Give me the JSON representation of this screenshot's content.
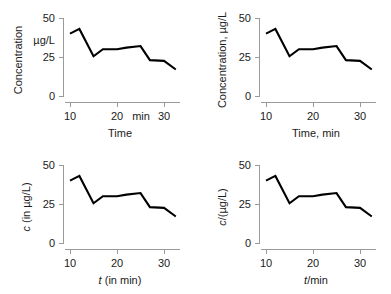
{
  "figure": {
    "name": "axis-labelling-conventions-figure",
    "panel_count": 4,
    "line_color": "#000000",
    "axis_color": "#9a9a9a"
  },
  "chart_data": [
    {
      "id": "top-left",
      "type": "line",
      "title": "",
      "xlabel": "Time",
      "ylabel": "Concentration",
      "y_unit_label": "µg/L",
      "x_unit_inline": "min",
      "xticks": [
        10,
        20,
        30
      ],
      "xticklabels": [
        "10",
        "20",
        "30"
      ],
      "yticks": [
        0,
        25,
        50
      ],
      "yticklabels": [
        "0",
        "25",
        "50"
      ],
      "xlim": [
        9,
        33.5
      ],
      "ylim": [
        0,
        50
      ],
      "grid": false,
      "legend": "none",
      "x": [
        10,
        12,
        15,
        17,
        20,
        22,
        25,
        27,
        30,
        32.5
      ],
      "values": [
        40,
        43,
        25.5,
        30,
        30,
        31,
        32,
        23,
        22.5,
        17
      ]
    },
    {
      "id": "top-right",
      "type": "line",
      "title": "",
      "xlabel": "Time, min",
      "ylabel": "Concentration, µg/L",
      "y_unit_label": "",
      "x_unit_inline": "",
      "xticks": [
        10,
        20,
        30
      ],
      "xticklabels": [
        "10",
        "20",
        "30"
      ],
      "yticks": [
        0,
        25,
        50
      ],
      "yticklabels": [
        "0",
        "25",
        "50"
      ],
      "xlim": [
        9,
        33.5
      ],
      "ylim": [
        0,
        50
      ],
      "grid": false,
      "legend": "none",
      "x": [
        10,
        12,
        15,
        17,
        20,
        22,
        25,
        27,
        30,
        32.5
      ],
      "values": [
        40,
        43,
        25.5,
        30,
        30,
        31,
        32,
        23,
        22.5,
        17
      ]
    },
    {
      "id": "bottom-left",
      "type": "line",
      "title": "",
      "xlabel": "t (in min)",
      "xlabel_symbol": "t",
      "xlabel_rest": " (in min)",
      "ylabel": "c (in µg/L)",
      "ylabel_symbol": "c",
      "ylabel_rest": " (in µg/L)",
      "y_unit_label": "",
      "x_unit_inline": "",
      "xticks": [
        10,
        20,
        30
      ],
      "xticklabels": [
        "10",
        "20",
        "30"
      ],
      "yticks": [
        0,
        25,
        50
      ],
      "yticklabels": [
        "0",
        "25",
        "50"
      ],
      "xlim": [
        9,
        33.5
      ],
      "ylim": [
        0,
        50
      ],
      "grid": false,
      "legend": "none",
      "x": [
        10,
        12,
        15,
        17,
        20,
        22,
        25,
        27,
        30,
        32.5
      ],
      "values": [
        40,
        43,
        25.5,
        30,
        30,
        31,
        32,
        23,
        22.5,
        17
      ]
    },
    {
      "id": "bottom-right",
      "type": "line",
      "title": "",
      "xlabel": "t/min",
      "xlabel_symbol": "t",
      "xlabel_rest": "/min",
      "ylabel": "c/(µg/L)",
      "ylabel_symbol": "c",
      "ylabel_rest": "/(µg/L)",
      "y_unit_label": "",
      "x_unit_inline": "",
      "xticks": [
        10,
        20,
        30
      ],
      "xticklabels": [
        "10",
        "20",
        "30"
      ],
      "yticks": [
        0,
        25,
        50
      ],
      "yticklabels": [
        "0",
        "25",
        "50"
      ],
      "xlim": [
        9,
        33.5
      ],
      "ylim": [
        0,
        50
      ],
      "grid": false,
      "legend": "none",
      "x": [
        10,
        12,
        15,
        17,
        20,
        22,
        25,
        27,
        30,
        32.5
      ],
      "values": [
        40,
        43,
        25.5,
        30,
        30,
        31,
        32,
        23,
        22.5,
        17
      ]
    }
  ]
}
